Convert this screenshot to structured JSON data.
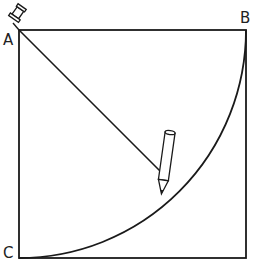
{
  "diagram": {
    "labels": {
      "a": "A",
      "b": "B",
      "c": "C"
    },
    "stroke_color": "#1a1a1a",
    "shapes": [
      "square",
      "diagonal-radius-line",
      "quarter-circle-arc",
      "pushpin",
      "pencil"
    ]
  }
}
